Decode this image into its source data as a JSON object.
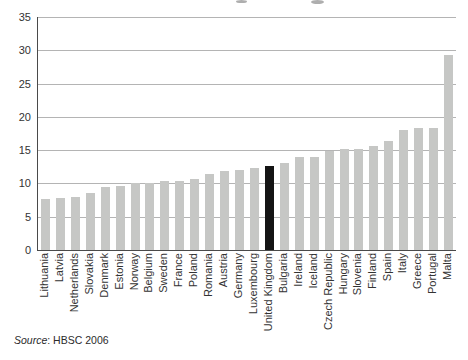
{
  "chart_data": {
    "type": "bar",
    "title": "",
    "categories": [
      "Lithuania",
      "Latvia",
      "Netherlands",
      "Slovakia",
      "Denmark",
      "Estonia",
      "Norway",
      "Belgium",
      "Sweden",
      "France",
      "Poland",
      "Romania",
      "Austria",
      "Germany",
      "Luxembourg",
      "United Kingdom",
      "Bulgaria",
      "Ireland",
      "Iceland",
      "Czech Republic",
      "Hungary",
      "Slovenia",
      "Finland",
      "Spain",
      "Italy",
      "Greece",
      "Portugal",
      "Malta"
    ],
    "values": [
      7.6,
      7.8,
      8.0,
      8.6,
      9.4,
      9.6,
      10.0,
      10.1,
      10.4,
      10.4,
      10.6,
      11.4,
      11.8,
      12.0,
      12.3,
      12.6,
      13.0,
      13.9,
      13.9,
      14.8,
      15.2,
      15.2,
      15.6,
      16.4,
      18.1,
      18.3,
      18.4,
      29.3
    ],
    "highlight_category": "United Kingdom",
    "xlabel": "",
    "ylabel": "",
    "ylim": [
      0,
      35
    ],
    "yticks": [
      0,
      5,
      10,
      15,
      20,
      25,
      30,
      35
    ],
    "grid": true,
    "legend": false,
    "bar_color": "#c6c7c5",
    "highlight_color": "#141414",
    "gridline_color": "#b4b4b4",
    "axis_color": "#4a4a4a",
    "tick_text_color": "#333333"
  },
  "source": {
    "prefix": "Source",
    "rest": ": HBSC 2006"
  }
}
